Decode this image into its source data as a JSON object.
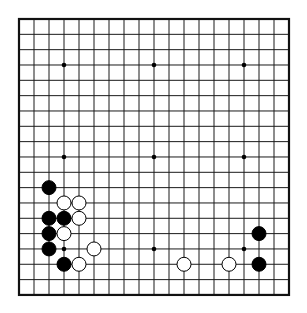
{
  "board": {
    "size": 19,
    "origin_x": 19,
    "origin_y": 19,
    "spacing_x": 15,
    "spacing_y": 15.33,
    "line_color": "#1a1a1a",
    "border_color": "#111111",
    "background": "#ffffff",
    "hoshi": [
      [
        3,
        3
      ],
      [
        9,
        3
      ],
      [
        15,
        3
      ],
      [
        3,
        9
      ],
      [
        9,
        9
      ],
      [
        15,
        9
      ],
      [
        3,
        15
      ],
      [
        9,
        15
      ],
      [
        15,
        15
      ]
    ],
    "stone_radius": 7,
    "black_color": "#000000",
    "white_fill": "#ffffff",
    "white_stroke": "#000000"
  },
  "stones": [
    {
      "color": "black",
      "col": 2,
      "row": 11
    },
    {
      "color": "white",
      "col": 3,
      "row": 12
    },
    {
      "color": "white",
      "col": 4,
      "row": 12
    },
    {
      "color": "black",
      "col": 2,
      "row": 13
    },
    {
      "color": "black",
      "col": 3,
      "row": 13
    },
    {
      "color": "white",
      "col": 4,
      "row": 13
    },
    {
      "color": "black",
      "col": 2,
      "row": 14
    },
    {
      "color": "white",
      "col": 3,
      "row": 14
    },
    {
      "color": "black",
      "col": 2,
      "row": 15
    },
    {
      "color": "white",
      "col": 5,
      "row": 15
    },
    {
      "color": "black",
      "col": 3,
      "row": 16
    },
    {
      "color": "white",
      "col": 4,
      "row": 16
    },
    {
      "color": "white",
      "col": 11,
      "row": 16
    },
    {
      "color": "white",
      "col": 14,
      "row": 16
    },
    {
      "color": "black",
      "col": 16,
      "row": 14
    },
    {
      "color": "black",
      "col": 16,
      "row": 16
    }
  ]
}
